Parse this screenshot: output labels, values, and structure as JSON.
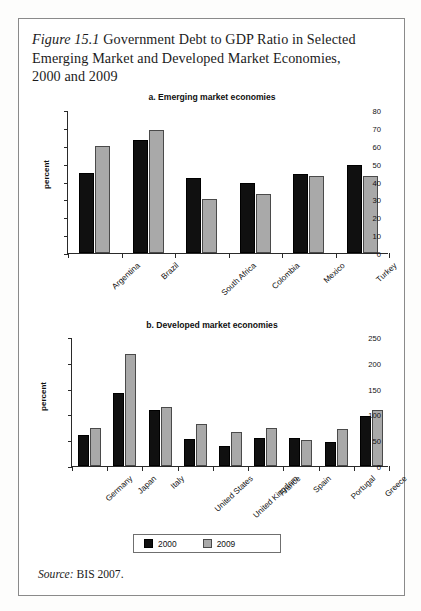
{
  "figure": {
    "label": "Figure 15.1",
    "title": "Government Debt to GDP Ratio in Selected Emerging Market and Developed Market Economies, 2000 and 2009",
    "source_keyword": "Source:",
    "source_text": "BIS 2007."
  },
  "legend": {
    "items": [
      {
        "label": "2000",
        "color": "#101010"
      },
      {
        "label": "2009",
        "color": "#a9a9a9"
      }
    ]
  },
  "chart_data": [
    {
      "type": "bar",
      "title": "a. Emerging market economies",
      "xlabel": "",
      "ylabel": "percent",
      "ylim": [
        0,
        80
      ],
      "yticks": [
        0,
        10,
        20,
        30,
        40,
        50,
        60,
        70,
        80
      ],
      "grid": false,
      "legend_position": "below-figure",
      "categories": [
        "Argentina",
        "Brazil",
        "South Africa",
        "Colombia",
        "Mexico",
        "Turkey"
      ],
      "series": [
        {
          "name": "2000",
          "color": "#101010",
          "values": [
            45,
            63,
            42,
            39,
            44,
            49
          ]
        },
        {
          "name": "2009",
          "color": "#a9a9a9",
          "values": [
            60,
            69,
            30,
            33,
            43,
            43
          ]
        }
      ]
    },
    {
      "type": "bar",
      "title": "b. Developed market economies",
      "xlabel": "",
      "ylabel": "percent",
      "ylim": [
        0,
        250
      ],
      "yticks": [
        0,
        50,
        100,
        150,
        200,
        250
      ],
      "grid": false,
      "legend_position": "below-figure",
      "categories": [
        "Germany",
        "Japan",
        "Italy",
        "United States",
        "United Kingdom",
        "France",
        "Spain",
        "Portugal",
        "Greece"
      ],
      "series": [
        {
          "name": "2000",
          "color": "#101010",
          "values": [
            61,
            141,
            108,
            52,
            39,
            54,
            55,
            46,
            97
          ]
        },
        {
          "name": "2009",
          "color": "#a9a9a9",
          "values": [
            73,
            218,
            114,
            81,
            65,
            73,
            50,
            72,
            108
          ]
        }
      ]
    }
  ]
}
